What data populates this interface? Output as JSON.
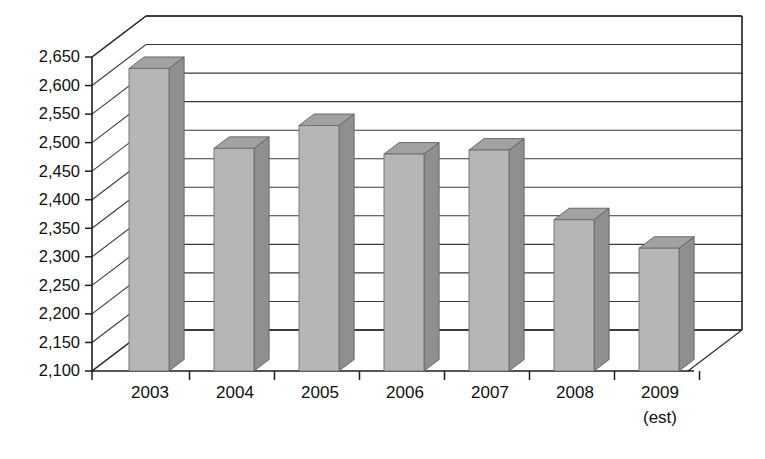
{
  "chart_data": {
    "type": "bar",
    "title": "",
    "subtitle": "",
    "xlabel": "",
    "ylabel": "",
    "categories": [
      "2003",
      "2004",
      "2005",
      "2006",
      "2007",
      "2008",
      "2009"
    ],
    "category_sublabels": [
      "",
      "",
      "",
      "",
      "",
      "",
      "(est)"
    ],
    "values": [
      2630,
      2490,
      2530,
      2480,
      2487,
      2365,
      2315
    ],
    "ylim": [
      2100,
      2650
    ],
    "ytick_labels": [
      "2,650",
      "2,600",
      "2,550",
      "2,500",
      "2,450",
      "2,400",
      "2,350",
      "2,300",
      "2,250",
      "2,200",
      "2,150",
      "2,100"
    ],
    "ytick_values": [
      2650,
      2600,
      2550,
      2500,
      2450,
      2400,
      2350,
      2300,
      2250,
      2200,
      2150,
      2100
    ],
    "ytick_step": 50,
    "grid": true,
    "legend": false,
    "legend_position": "none",
    "style": "3d-column",
    "colors": {
      "bar_front": "#b6b6b6",
      "bar_side": "#8f8f8f",
      "bar_top": "#a2a2a2",
      "axis": "#1d1d1d",
      "grid": "#3a3a3a",
      "background": "#ffffff",
      "text": "#101010"
    }
  },
  "geometry": {
    "plot_left": 92,
    "plot_bottom": 371,
    "plot_right": 688,
    "depth_dx": 54,
    "depth_dy": -41,
    "bar_width": 40,
    "bar_slot": 85,
    "bar_first_center": 149
  },
  "caption": {
    "faint_text": ""
  }
}
